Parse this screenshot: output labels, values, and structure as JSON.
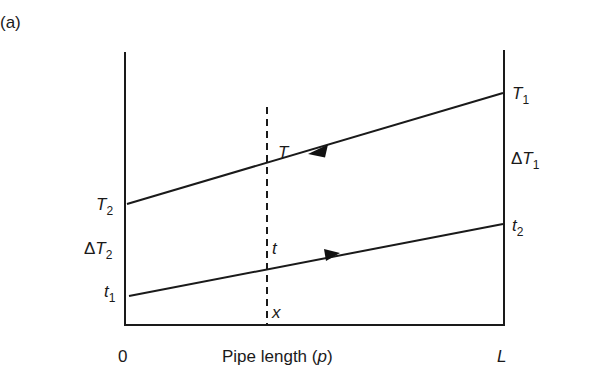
{
  "figure": {
    "panel_label": "(a)",
    "x_axis": {
      "start_label": "0",
      "end_label": "L",
      "title_prefix": "Pipe length (",
      "title_var": "p",
      "title_suffix": ")"
    },
    "left_labels": {
      "T2": {
        "main": "T",
        "sub": "2"
      },
      "dT2": {
        "delta": "Δ",
        "main": "T",
        "sub": "2"
      },
      "t1": {
        "main": "t",
        "sub": "1"
      }
    },
    "right_labels": {
      "T1": {
        "main": "T",
        "sub": "1"
      },
      "dT1": {
        "delta": "Δ",
        "main": "T",
        "sub": "1"
      },
      "t2": {
        "main": "t",
        "sub": "2"
      }
    },
    "inner_labels": {
      "T": "T",
      "t": "t",
      "x": "x"
    },
    "lines": [
      {
        "name": "hot-fluid-T",
        "from": "T1 at L",
        "to": "T2 at 0",
        "flow_direction": "right-to-left"
      },
      {
        "name": "cold-fluid-t",
        "from": "t1 at 0",
        "to": "t2 at L",
        "flow_direction": "left-to-right"
      }
    ],
    "colors": {
      "ink": "#1a1a1a",
      "background": "#ffffff"
    }
  }
}
